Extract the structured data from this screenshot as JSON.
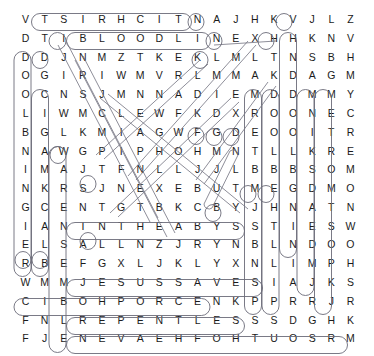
{
  "puzzle": {
    "kind": "word-search",
    "title": "Word Search Puzzle",
    "rows": 18,
    "cols": 18,
    "letter_color": "#1b1b1b",
    "highlight_color": "#6b6b78",
    "background_color": "#ffffff",
    "grid": [
      [
        "V",
        "T",
        "S",
        "I",
        "R",
        "H",
        "C",
        "I",
        "T",
        "N",
        "A",
        "J",
        "H",
        "K",
        "V",
        "J",
        "L",
        "Z"
      ],
      [
        "D",
        "T",
        "I",
        "B",
        "L",
        "O",
        "O",
        "D",
        "L",
        "I",
        "N",
        "E",
        "X",
        "H",
        "H",
        "K",
        "N",
        "V"
      ],
      [
        "D",
        "D",
        "J",
        "N",
        "M",
        "Z",
        "T",
        "K",
        "E",
        "K",
        "L",
        "M",
        "L",
        "T",
        "N",
        "S",
        "B",
        "H"
      ],
      [
        "O",
        "G",
        "I",
        "R",
        "I",
        "W",
        "M",
        "V",
        "R",
        "L",
        "M",
        "M",
        "A",
        "K",
        "D",
        "A",
        "G",
        "M"
      ],
      [
        "O",
        "C",
        "N",
        "S",
        "J",
        "M",
        "N",
        "N",
        "A",
        "D",
        "I",
        "E",
        "M",
        "D",
        "D",
        "M",
        "M",
        "Y"
      ],
      [
        "L",
        "I",
        "W",
        "M",
        "C",
        "L",
        "E",
        "W",
        "F",
        "K",
        "D",
        "X",
        "R",
        "O",
        "O",
        "N",
        "E",
        "C"
      ],
      [
        "B",
        "G",
        "L",
        "K",
        "M",
        "I",
        "A",
        "G",
        "W",
        "F",
        "G",
        "D",
        "E",
        "O",
        "O",
        "I",
        "T",
        "R"
      ],
      [
        "N",
        "A",
        "W",
        "G",
        "P",
        "I",
        "P",
        "H",
        "O",
        "H",
        "M",
        "N",
        "T",
        "L",
        "L",
        "K",
        "R",
        "E"
      ],
      [
        "I",
        "M",
        "A",
        "J",
        "T",
        "F",
        "N",
        "L",
        "L",
        "J",
        "J",
        "L",
        "B",
        "B",
        "B",
        "S",
        "O",
        "M"
      ],
      [
        "N",
        "K",
        "R",
        "S",
        "J",
        "N",
        "E",
        "X",
        "E",
        "B",
        "U",
        "T",
        "M",
        "E",
        "G",
        "D",
        "M",
        "O"
      ],
      [
        "G",
        "C",
        "E",
        "N",
        "T",
        "G",
        "T",
        "B",
        "K",
        "C",
        "B",
        "Y",
        "J",
        "H",
        "N",
        "A",
        "T",
        "N"
      ],
      [
        "I",
        "A",
        "N",
        "I",
        "N",
        "T",
        "H",
        "E",
        "A",
        "B",
        "Y",
        "S",
        "S",
        "T",
        "I",
        "E",
        "S",
        "W"
      ],
      [
        "E",
        "L",
        "S",
        "A",
        "L",
        "L",
        "N",
        "Z",
        "J",
        "R",
        "Y",
        "N",
        "B",
        "L",
        "N",
        "D",
        "O",
        "O"
      ],
      [
        "R",
        "B",
        "E",
        "F",
        "G",
        "X",
        "L",
        "J",
        "K",
        "L",
        "Y",
        "X",
        "N",
        "L",
        "I",
        "M",
        "P",
        "H"
      ],
      [
        "W",
        "M",
        "M",
        "J",
        "E",
        "S",
        "U",
        "S",
        "S",
        "A",
        "V",
        "E",
        "S",
        "I",
        "A",
        "J",
        "K",
        "S"
      ],
      [
        "C",
        "I",
        "B",
        "O",
        "H",
        "P",
        "O",
        "R",
        "C",
        "E",
        "N",
        "K",
        "P",
        "P",
        "R",
        "R",
        "J",
        "R"
      ],
      [
        "F",
        "N",
        "L",
        "R",
        "E",
        "P",
        "E",
        "N",
        "T",
        "L",
        "E",
        "S",
        "S",
        "S",
        "D",
        "G",
        "H",
        "K"
      ],
      [
        "F",
        "J",
        "E",
        "N",
        "E",
        "V",
        "A",
        "E",
        "H",
        "F",
        "O",
        "H",
        "T",
        "U",
        "O",
        "S",
        "R",
        "M"
      ]
    ],
    "found_words": [
      {
        "text": "ANTICHRIST",
        "direction": "horizontal-reversed",
        "row": 1,
        "start_col": 2,
        "end_col": 11
      },
      {
        "text": "BLOODLINE",
        "direction": "horizontal",
        "row": 2,
        "start_col": 4,
        "end_col": 12
      },
      {
        "text": "IN THE ABYSS",
        "direction": "horizontal",
        "row": 12,
        "start_col": 4,
        "end_col": 13
      },
      {
        "text": "JESUS SAVES",
        "direction": "horizontal",
        "row": 15,
        "start_col": 4,
        "end_col": 14
      },
      {
        "text": "NECROPHOBIC",
        "direction": "horizontal-reversed",
        "row": 16,
        "start_col": 1,
        "end_col": 11
      },
      {
        "text": "REPENTLESS",
        "direction": "horizontal",
        "row": 17,
        "start_col": 4,
        "end_col": 13
      },
      {
        "text": "SOUTH OF HEAVEN",
        "direction": "horizontal-reversed",
        "row": 18,
        "start_col": 4,
        "end_col": 18
      },
      {
        "text": "DEAD SKIN MASK",
        "direction": "vertical-reversed",
        "col": 16,
        "start_row": 2,
        "end_row": 13
      },
      {
        "text": "POSTMORTEM",
        "direction": "vertical-reversed",
        "col": 17,
        "start_row": 5,
        "end_row": 14
      },
      {
        "text": "SHOW NO MERCY",
        "direction": "vertical-reversed",
        "col": 18,
        "start_row": 5,
        "end_row": 15
      },
      {
        "text": "WAR ENSEMBLE",
        "direction": "vertical",
        "col": 3,
        "start_row": 8,
        "end_row": 18
      },
      {
        "text": "DIABOLUS",
        "direction": "vertical",
        "col": 2,
        "start_row": 5,
        "end_row": 14
      },
      {
        "text": "SPILL THE BLOOD",
        "direction": "vertical-reversed",
        "col": 14,
        "start_row": 5,
        "end_row": 17
      },
      {
        "text": "DRAINING BLOOD",
        "direction": "vertical-reversed",
        "col": 15,
        "start_row": 5,
        "end_row": 17
      },
      {
        "text": "SEASONS IN THE ABYSS",
        "direction": "vertical",
        "col": 1,
        "start_row": 3,
        "end_row": 14
      }
    ]
  }
}
